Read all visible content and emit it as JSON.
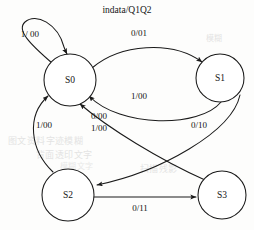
{
  "diagram": {
    "title": "indata/Q1Q2",
    "type": "mealy-state-machine",
    "background_color": "#fdfdfc",
    "stroke_color": "#1a1a1a",
    "states": [
      {
        "id": "S0",
        "label": "S0",
        "cx": 70,
        "cy": 80,
        "r": 26
      },
      {
        "id": "S1",
        "label": "S1",
        "cx": 220,
        "cy": 78,
        "r": 24
      },
      {
        "id": "S2",
        "label": "S2",
        "cx": 68,
        "cy": 195,
        "r": 26
      },
      {
        "id": "S3",
        "label": "S3",
        "cx": 222,
        "cy": 195,
        "r": 24
      }
    ],
    "transitions": [
      {
        "id": "t-s0-s0",
        "from": "S0",
        "to": "S0",
        "label": "1/ 00",
        "label_x": 30,
        "label_y": 35
      },
      {
        "id": "t-s0-s1",
        "from": "S0",
        "to": "S1",
        "label": "0/01",
        "label_x": 139,
        "label_y": 34
      },
      {
        "id": "t-s1-s0",
        "from": "S1",
        "to": "S0",
        "label": "1/00",
        "label_x": 139,
        "label_y": 97
      },
      {
        "id": "t-s3-s0",
        "from": "S3",
        "to": "S0",
        "label": "0/00",
        "label_x": 99,
        "label_y": 117
      },
      {
        "id": "t-s3-s0b",
        "from": "S3",
        "to": "S0",
        "label": "1/00",
        "label_x": 99,
        "label_y": 129
      },
      {
        "id": "t-s2-s0",
        "from": "S2",
        "to": "S0",
        "label": "1/00",
        "label_x": 44,
        "label_y": 126
      },
      {
        "id": "t-s1-s2",
        "from": "S1",
        "to": "S2",
        "label": "0/10",
        "label_x": 199,
        "label_y": 126
      },
      {
        "id": "t-s2-s3",
        "from": "S2",
        "to": "S3",
        "label": "0/11",
        "label_x": 140,
        "label_y": 209
      }
    ],
    "watermarks": [
      {
        "id": "wm-1",
        "text": "图文资料字迹模糊"
      },
      {
        "id": "wm-2",
        "text": "背面透印文字"
      },
      {
        "id": "wm-3",
        "text": "扫描残影"
      },
      {
        "id": "wm-4",
        "text": "模糊"
      },
      {
        "id": "wm-5",
        "text": "模糊文字"
      }
    ]
  }
}
